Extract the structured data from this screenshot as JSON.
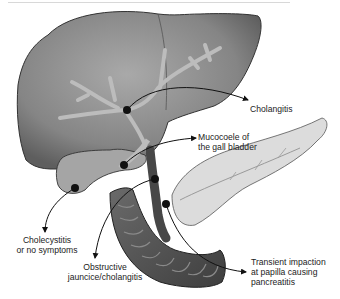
{
  "figure": {
    "structures": [
      "liver",
      "bile ducts",
      "gall bladder",
      "common bile duct",
      "duodenum",
      "pancreas"
    ],
    "stone_markers": [
      {
        "name": "intrahepatic-duct-stone",
        "x": 127,
        "y": 110
      },
      {
        "name": "cystic-duct-stone",
        "x": 124,
        "y": 165
      },
      {
        "name": "gallbladder-stone",
        "x": 75,
        "y": 188
      },
      {
        "name": "common-bile-duct-stone",
        "x": 155,
        "y": 179
      },
      {
        "name": "papilla-stone",
        "x": 166,
        "y": 204
      }
    ],
    "colors": {
      "liver": "#7a7a7a",
      "liver_highlight": "#a8a8a8",
      "duct": "#b9b9b9",
      "duodenum": "#5a5a5a",
      "pancreas": "#d9d9d9",
      "stone": "#111111",
      "text": "#222222"
    }
  },
  "labels": {
    "cholangitis": {
      "lines": [
        "Cholangitis"
      ]
    },
    "mucocoele": {
      "lines": [
        "Mucocoele of",
        "the gall bladder"
      ]
    },
    "cholecystitis": {
      "lines": [
        "Cholecystitis",
        "or no symptoms"
      ]
    },
    "obstructive": {
      "lines": [
        "Obstructive",
        "jauncice/cholangitis"
      ]
    },
    "transient": {
      "lines": [
        "Transient impaction",
        "at papilla causing",
        "pancreatitis"
      ]
    }
  }
}
